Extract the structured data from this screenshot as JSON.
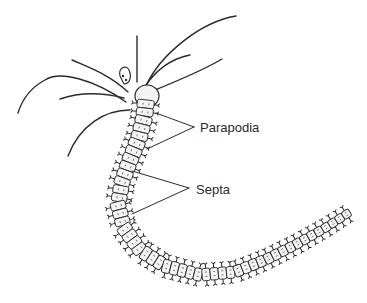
{
  "diagram": {
    "colors": {
      "ink": "#2a2a2a",
      "background": "#ffffff",
      "segment_fill": "#f4f4f4"
    },
    "labels": [
      {
        "id": "parapodia",
        "text": "Parapodia",
        "x": 200,
        "y": 121,
        "pointer_targets": [
          [
            156,
            113
          ],
          [
            147,
            149
          ]
        ],
        "pointer_origin": [
          194,
          127
        ]
      },
      {
        "id": "septa",
        "text": "Septa",
        "x": 196,
        "y": 183,
        "pointer_targets": [
          [
            132,
            171
          ],
          [
            132,
            214
          ]
        ],
        "pointer_origin": [
          189,
          188
        ]
      }
    ],
    "body_path": [
      [
        146,
        100
      ],
      [
        144,
        118
      ],
      [
        139,
        138
      ],
      [
        130,
        160
      ],
      [
        122,
        182
      ],
      [
        118,
        205
      ],
      [
        124,
        228
      ],
      [
        140,
        250
      ],
      [
        165,
        266
      ],
      [
        200,
        275
      ],
      [
        235,
        272
      ],
      [
        265,
        260
      ],
      [
        295,
        245
      ],
      [
        325,
        228
      ],
      [
        350,
        212
      ]
    ],
    "segment_count": 48
  }
}
